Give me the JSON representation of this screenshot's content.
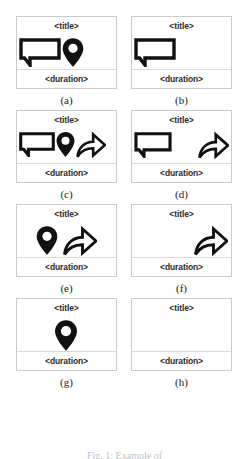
{
  "figure": {
    "caption": "Fig. 1: Example of",
    "title_placeholder": "<title>",
    "duration_placeholder": "<duration>"
  },
  "icons": {
    "bubble": "speech-bubble-icon",
    "pin": "map-pin-icon",
    "arrow": "share-arrow-icon"
  },
  "colors": {
    "card_border": "#c9cbcd",
    "divider": "#d6d8da",
    "icon": "#111111",
    "text": "#2b2b2b",
    "background": "#ffffff"
  },
  "panels": [
    {
      "id": "a",
      "label": "(a)",
      "title": "<title>",
      "duration": "<duration>",
      "icons": [
        "speech-bubble-icon",
        "map-pin-icon"
      ]
    },
    {
      "id": "b",
      "label": "(b)",
      "title": "<title>",
      "duration": "<duration>",
      "icons": [
        "speech-bubble-icon"
      ]
    },
    {
      "id": "c",
      "label": "(c)",
      "title": "<title>",
      "duration": "<duration>",
      "icons": [
        "speech-bubble-icon",
        "map-pin-icon",
        "share-arrow-icon"
      ]
    },
    {
      "id": "d",
      "label": "(d)",
      "title": "<title>",
      "duration": "<duration>",
      "icons": [
        "speech-bubble-icon",
        "share-arrow-icon"
      ]
    },
    {
      "id": "e",
      "label": "(e)",
      "title": "<title>",
      "duration": "<duration>",
      "icons": [
        "map-pin-icon",
        "share-arrow-icon"
      ]
    },
    {
      "id": "f",
      "label": "(f)",
      "title": "<title>",
      "duration": "<duration>",
      "icons": [
        "share-arrow-icon"
      ]
    },
    {
      "id": "g",
      "label": "(g)",
      "title": "<title>",
      "duration": "<duration>",
      "icons": [
        "map-pin-icon"
      ]
    },
    {
      "id": "h",
      "label": "(h)",
      "title": "<title>",
      "duration": "<duration>",
      "icons": []
    }
  ]
}
